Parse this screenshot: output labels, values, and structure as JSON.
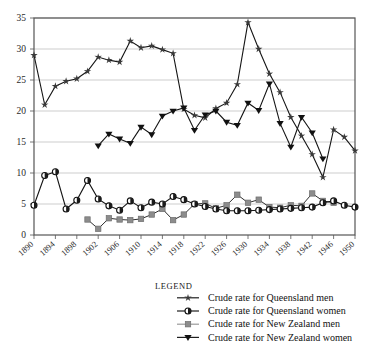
{
  "chart_data": {
    "type": "line",
    "title": "",
    "xlabel": "",
    "ylabel": "",
    "xlim": [
      1890,
      1950
    ],
    "ylim": [
      0,
      35
    ],
    "grid": true,
    "legend_position": "bottom",
    "legend_title": "Legend",
    "y_ticks": [
      0,
      5,
      10,
      15,
      20,
      25,
      30,
      35
    ],
    "x_ticks": [
      1890,
      1894,
      1898,
      1902,
      1906,
      1910,
      1914,
      1918,
      1922,
      1926,
      1930,
      1934,
      1938,
      1942,
      1946,
      1950
    ],
    "x_tick_labels": [
      "1890",
      "1894",
      "1898",
      "1902",
      "1906",
      "1910",
      "1914",
      "1918",
      "1922",
      "1926",
      "1930",
      "1934",
      "1938",
      "1942",
      "1946",
      "1950"
    ],
    "y_tick_labels": [
      "0",
      "5",
      "10",
      "15",
      "20",
      "25",
      "30",
      "35"
    ],
    "series": [
      {
        "name": "Crude rate for Queensland men",
        "marker": "star",
        "color": "#3a3a3a",
        "x": [
          1890,
          1892,
          1894,
          1896,
          1898,
          1900,
          1902,
          1904,
          1906,
          1908,
          1910,
          1912,
          1914,
          1916,
          1918,
          1920,
          1922,
          1924,
          1926,
          1928,
          1930,
          1932,
          1934,
          1936,
          1938,
          1940,
          1942,
          1944,
          1946,
          1948,
          1950
        ],
        "values": [
          29.0,
          21.0,
          24.0,
          24.8,
          25.2,
          26.4,
          28.7,
          28.2,
          27.9,
          31.3,
          30.2,
          30.5,
          29.9,
          29.3,
          20.3,
          19.3,
          18.9,
          20.4,
          21.3,
          24.3,
          34.3,
          30.0,
          26.0,
          23.0,
          19.0,
          16.0,
          13.0,
          9.3,
          17.0,
          15.8,
          13.6
        ]
      },
      {
        "name": "Crude rate for Queensland women",
        "marker": "circle",
        "color": "#2a2a2a",
        "x": [
          1890,
          1892,
          1894,
          1896,
          1898,
          1900,
          1902,
          1904,
          1906,
          1908,
          1910,
          1912,
          1914,
          1916,
          1918,
          1920,
          1922,
          1924,
          1926,
          1928,
          1930,
          1932,
          1934,
          1936,
          1938,
          1940,
          1942,
          1944,
          1946,
          1948,
          1950
        ],
        "values": [
          4.8,
          9.6,
          10.2,
          4.2,
          5.6,
          8.8,
          5.8,
          4.7,
          4.0,
          5.5,
          4.4,
          5.3,
          5.0,
          6.2,
          5.7,
          5.0,
          4.6,
          4.2,
          3.9,
          3.9,
          3.9,
          4.0,
          4.1,
          4.2,
          4.3,
          4.4,
          4.5,
          5.2,
          5.5,
          4.8,
          4.5
        ]
      },
      {
        "name": "Crude rate for New Zealand men",
        "marker": "square",
        "color": "#8c8c8c",
        "x": [
          1900,
          1902,
          1904,
          1906,
          1908,
          1910,
          1912,
          1914,
          1916,
          1918,
          1920,
          1922,
          1924,
          1926,
          1928,
          1930,
          1932,
          1934,
          1936,
          1938,
          1940,
          1942,
          1944,
          1946
        ],
        "values": [
          2.5,
          1.0,
          2.7,
          2.5,
          2.4,
          2.6,
          3.3,
          4.2,
          2.4,
          3.3,
          5.0,
          5.1,
          4.3,
          4.8,
          6.5,
          5.2,
          5.7,
          4.5,
          4.4,
          4.8,
          4.7,
          6.7,
          5.5,
          5.2
        ]
      },
      {
        "name": "Crude rate for New Zealand women",
        "marker": "triangle-down",
        "color": "#111111",
        "x": [
          1902,
          1904,
          1906,
          1908,
          1910,
          1912,
          1914,
          1916,
          1918,
          1920,
          1922,
          1924,
          1926,
          1928,
          1930,
          1932,
          1934,
          1936,
          1938,
          1940,
          1942,
          1944
        ],
        "values": [
          14.4,
          16.3,
          15.5,
          14.8,
          17.4,
          16.2,
          19.2,
          20.0,
          20.5,
          16.9,
          19.4,
          20.0,
          18.2,
          17.7,
          21.3,
          20.1,
          24.4,
          18.0,
          14.2,
          19.0,
          16.5,
          12.3
        ]
      }
    ]
  },
  "legend": {
    "title": "Legend",
    "items": [
      {
        "label": "Crude rate for Queensland men",
        "marker": "star",
        "color": "#3a3a3a"
      },
      {
        "label": "Crude rate for Queensland women",
        "marker": "circle",
        "color": "#2a2a2a"
      },
      {
        "label": "Crude rate for New Zealand men",
        "marker": "square",
        "color": "#8c8c8c"
      },
      {
        "label": "Crude rate for New Zealand women",
        "marker": "triangle-down",
        "color": "#111111"
      }
    ]
  }
}
